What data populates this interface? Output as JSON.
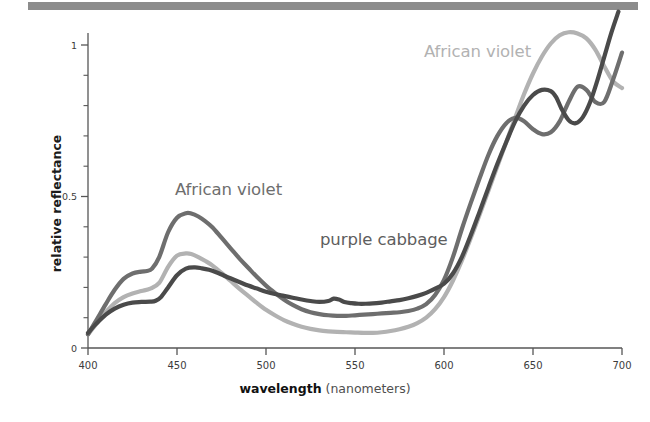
{
  "figure": {
    "background_color": "#ffffff",
    "top_bar_color": "#8c8c8c"
  },
  "axes": {
    "x_title_bold": "wavelength",
    "x_title_rest": " (nanometers)",
    "y_title": "relative reflectance",
    "x_ticks": [
      "400",
      "450",
      "500",
      "550",
      "600",
      "650",
      "700"
    ],
    "y_ticks": [
      "0",
      "0.5",
      "1"
    ]
  },
  "labels": {
    "african_violet_left": "African violet",
    "african_violet_right": "African violet",
    "purple_cabbage": "purple cabbage"
  },
  "chart_data": {
    "type": "line",
    "title": "",
    "xlabel": "wavelength (nanometers)",
    "ylabel": "relative reflectance",
    "xlim": [
      400,
      700
    ],
    "ylim": [
      0,
      1.12
    ],
    "xticks": [
      400,
      450,
      500,
      550,
      600,
      650,
      700
    ],
    "yticks": [
      0,
      0.5,
      1
    ],
    "minor_yticks": [
      0.1,
      0.2,
      0.3,
      0.4,
      0.6,
      0.7,
      0.8,
      0.9
    ],
    "grid": false,
    "legend": "inline-annotations",
    "annotations": [
      {
        "text": "African violet",
        "x": 437,
        "y": 0.545,
        "color": "#6e6e6e"
      },
      {
        "text": "African violet",
        "x": 589,
        "y": 0.99,
        "color": "#b2b2b2"
      },
      {
        "text": "purple cabbage",
        "x": 530,
        "y": 0.7,
        "color": "#5e5e5e"
      }
    ],
    "series": [
      {
        "name": "African violet (dark)",
        "color": "#6e6e6e",
        "linewidth": 4.2,
        "x": [
          400,
          405,
          410,
          415,
          420,
          425,
          430,
          433,
          436,
          440,
          445,
          450,
          455,
          458,
          462,
          466,
          470,
          475,
          480,
          485,
          490,
          495,
          500,
          505,
          510,
          515,
          520,
          525,
          530,
          535,
          540,
          545,
          550,
          555,
          560,
          565,
          570,
          575,
          580,
          585,
          590,
          595,
          600,
          605,
          610,
          615,
          620,
          625,
          630,
          635,
          640,
          645,
          650,
          655,
          660,
          665,
          670,
          675,
          680,
          685,
          690,
          695,
          700
        ],
        "y": [
          0.045,
          0.095,
          0.145,
          0.192,
          0.228,
          0.246,
          0.252,
          0.254,
          0.262,
          0.3,
          0.382,
          0.43,
          0.445,
          0.444,
          0.434,
          0.418,
          0.398,
          0.364,
          0.33,
          0.296,
          0.265,
          0.234,
          0.206,
          0.182,
          0.16,
          0.142,
          0.128,
          0.118,
          0.112,
          0.108,
          0.106,
          0.106,
          0.108,
          0.11,
          0.112,
          0.114,
          0.116,
          0.118,
          0.122,
          0.13,
          0.145,
          0.175,
          0.225,
          0.3,
          0.392,
          0.478,
          0.56,
          0.638,
          0.7,
          0.742,
          0.76,
          0.748,
          0.722,
          0.706,
          0.712,
          0.748,
          0.812,
          0.862,
          0.852,
          0.812,
          0.812,
          0.886,
          0.975
        ]
      },
      {
        "name": "African violet (light)",
        "color": "#b2b2b2",
        "linewidth": 4.2,
        "x": [
          400,
          405,
          410,
          415,
          420,
          425,
          430,
          435,
          440,
          445,
          450,
          455,
          458,
          462,
          466,
          470,
          475,
          480,
          485,
          490,
          495,
          500,
          505,
          510,
          515,
          520,
          525,
          530,
          535,
          540,
          545,
          550,
          555,
          560,
          565,
          570,
          575,
          580,
          585,
          590,
          595,
          600,
          605,
          610,
          615,
          620,
          625,
          630,
          635,
          640,
          645,
          650,
          655,
          660,
          665,
          670,
          675,
          680,
          685,
          690,
          695,
          700
        ],
        "y": [
          0.045,
          0.082,
          0.118,
          0.148,
          0.168,
          0.18,
          0.188,
          0.196,
          0.215,
          0.268,
          0.305,
          0.312,
          0.31,
          0.3,
          0.287,
          0.272,
          0.248,
          0.222,
          0.196,
          0.172,
          0.148,
          0.126,
          0.108,
          0.092,
          0.08,
          0.07,
          0.063,
          0.058,
          0.055,
          0.053,
          0.052,
          0.051,
          0.05,
          0.05,
          0.052,
          0.056,
          0.062,
          0.07,
          0.082,
          0.1,
          0.128,
          0.168,
          0.222,
          0.288,
          0.362,
          0.44,
          0.52,
          0.6,
          0.68,
          0.76,
          0.838,
          0.906,
          0.962,
          1.005,
          1.032,
          1.042,
          1.038,
          1.022,
          0.985,
          0.93,
          0.88,
          0.858
        ]
      },
      {
        "name": "purple cabbage",
        "color": "#4a4a4a",
        "linewidth": 4.2,
        "x": [
          400,
          405,
          410,
          415,
          420,
          425,
          430,
          435,
          438,
          441,
          445,
          450,
          455,
          460,
          464,
          468,
          472,
          476,
          480,
          485,
          490,
          495,
          500,
          505,
          510,
          515,
          520,
          525,
          530,
          535,
          538,
          541,
          544,
          548,
          552,
          556,
          560,
          565,
          570,
          575,
          580,
          585,
          590,
          595,
          600,
          605,
          610,
          615,
          620,
          625,
          630,
          635,
          640,
          645,
          650,
          655,
          660,
          663,
          666,
          670,
          674,
          678,
          682,
          686,
          690,
          694,
          698
        ],
        "y": [
          0.05,
          0.082,
          0.11,
          0.13,
          0.143,
          0.15,
          0.152,
          0.153,
          0.156,
          0.168,
          0.2,
          0.24,
          0.262,
          0.266,
          0.263,
          0.258,
          0.25,
          0.24,
          0.23,
          0.218,
          0.206,
          0.196,
          0.186,
          0.178,
          0.172,
          0.166,
          0.16,
          0.155,
          0.152,
          0.155,
          0.163,
          0.16,
          0.152,
          0.148,
          0.146,
          0.146,
          0.147,
          0.15,
          0.154,
          0.158,
          0.164,
          0.172,
          0.182,
          0.196,
          0.212,
          0.246,
          0.3,
          0.372,
          0.45,
          0.53,
          0.608,
          0.68,
          0.748,
          0.8,
          0.835,
          0.852,
          0.848,
          0.828,
          0.79,
          0.752,
          0.742,
          0.762,
          0.81,
          0.88,
          0.96,
          1.04,
          1.11
        ]
      }
    ]
  }
}
